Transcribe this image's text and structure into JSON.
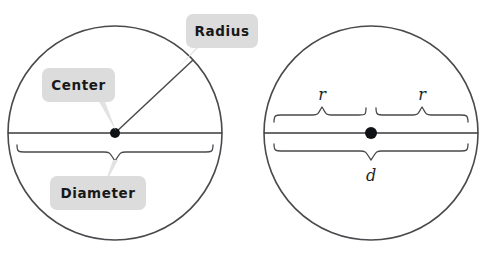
{
  "figure": {
    "background_color": "#ffffff",
    "stroke_color": "#4a4a4e",
    "label_box_color": "#dcdcdc",
    "label_text_color": "#17181a",
    "dot_color": "#101114"
  },
  "left_diagram": {
    "name": "labeled-circle",
    "callouts": [
      {
        "id": "radius",
        "label": "Radius"
      },
      {
        "id": "center",
        "label": "Center"
      },
      {
        "id": "diameter",
        "label": "Diameter"
      }
    ],
    "features": [
      {
        "id": "circle-outline",
        "label": "circle"
      },
      {
        "id": "radius-segment",
        "label": "radius segment"
      },
      {
        "id": "diameter-segment",
        "label": "diameter segment"
      },
      {
        "id": "center-point",
        "label": "center point"
      },
      {
        "id": "diameter-brace",
        "label": "diameter brace"
      }
    ]
  },
  "right_diagram": {
    "name": "variable-circle",
    "labels": [
      {
        "id": "radius-left",
        "text": "r"
      },
      {
        "id": "radius-right",
        "text": "r"
      },
      {
        "id": "diameter",
        "text": "d"
      }
    ],
    "features": [
      {
        "id": "circle-outline",
        "label": "circle"
      },
      {
        "id": "diameter-segment",
        "label": "diameter segment"
      },
      {
        "id": "center-point",
        "label": "center point"
      },
      {
        "id": "radius-brace-left",
        "label": "left radius brace"
      },
      {
        "id": "radius-brace-right",
        "label": "right radius brace"
      },
      {
        "id": "diameter-brace",
        "label": "diameter brace"
      }
    ]
  },
  "geometry": {
    "left_circle": {
      "cx": 115,
      "cy": 133,
      "r": 107
    },
    "right_circle": {
      "cx": 371,
      "cy": 133,
      "r": 107
    }
  }
}
